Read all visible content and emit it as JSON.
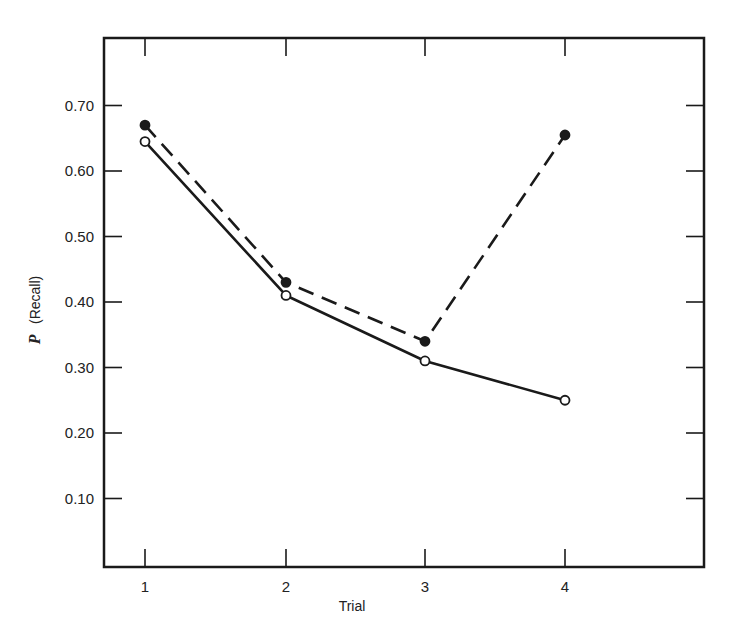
{
  "chart_data": {
    "type": "line",
    "title": "",
    "xlabel": "Trial",
    "ylabel": "P (Recall)",
    "ylabel_parts": {
      "symbol": "P",
      "text": "(Recall)"
    },
    "x": [
      1,
      2,
      3,
      4
    ],
    "x_tick_labels": [
      "1",
      "2",
      "3",
      "4"
    ],
    "xlim": [
      0.7,
      5.0
    ],
    "ylim": [
      0.0,
      0.8
    ],
    "y_ticks": [
      0.1,
      0.2,
      0.3,
      0.4,
      0.5,
      0.6,
      0.7
    ],
    "y_tick_labels": [
      "0.10",
      "0.20",
      "0.30",
      "0.40",
      "0.50",
      "0.60",
      "0.70"
    ],
    "grid": false,
    "legend": null,
    "frame": "box with inward ticks on all four sides",
    "series": [
      {
        "name": "Filled circles (dashed line)",
        "marker": "filled-circle",
        "line_style": "dashed",
        "color": "#1a1a1a",
        "values": [
          0.67,
          0.43,
          0.34,
          0.655
        ]
      },
      {
        "name": "Open circles (solid line)",
        "marker": "open-circle",
        "line_style": "solid",
        "color": "#1a1a1a",
        "values": [
          0.645,
          0.41,
          0.31,
          0.25
        ]
      }
    ]
  },
  "layout": {
    "plot": {
      "left": 104,
      "right": 704,
      "top": 38,
      "bottom": 567
    },
    "x_pixel": {
      "1": 145,
      "2": 286,
      "3": 425,
      "4": 565
    },
    "y_zero_px": 564,
    "y_px_per_unit": 655
  }
}
